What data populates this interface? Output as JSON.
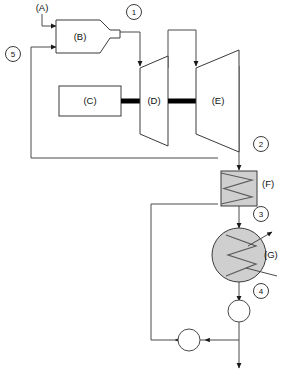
{
  "diagram": {
    "type": "process-flow-diagram",
    "background_color": "#ffffff",
    "line_color": "#4a4a4a",
    "shade_color": "#cfcfcf",
    "shaft_color": "#000000"
  },
  "components": {
    "a": {
      "label": "(A)",
      "role": "external-inlet-stream"
    },
    "b": {
      "label": "(B)",
      "role": "combustor"
    },
    "c": {
      "label": "(C)",
      "role": "compressor-driver-block"
    },
    "d": {
      "label": "(D)",
      "role": "high-pressure-turbine"
    },
    "e": {
      "label": "(E)",
      "role": "low-pressure-turbine"
    },
    "f": {
      "label": "(F)",
      "role": "heat-exchanger-rectangular"
    },
    "g": {
      "label": "(G)",
      "role": "condenser-circular"
    }
  },
  "state_markers": [
    {
      "id": "1",
      "label": "1"
    },
    {
      "id": "2",
      "label": "2"
    },
    {
      "id": "3",
      "label": "3"
    },
    {
      "id": "4",
      "label": "4"
    },
    {
      "id": "5",
      "label": "5"
    }
  ],
  "stream_labels": {
    "inlet": "(A)",
    "recycle": "5"
  }
}
